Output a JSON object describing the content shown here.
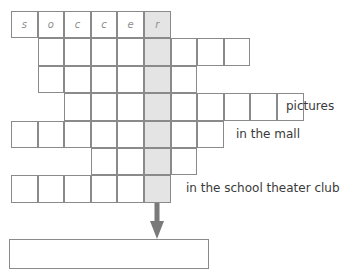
{
  "puzzle": {
    "grid_origin": {
      "x": 11,
      "y": 11
    },
    "cell_size": {
      "w": 26.6,
      "h": 27.4
    },
    "shaded_column": 5,
    "shade_color": "#e4e4e4",
    "border_color": "#8a8a8a",
    "rows": [
      {
        "start_col": 0,
        "length": 6,
        "letters": [
          "s",
          "o",
          "c",
          "c",
          "e",
          "r"
        ],
        "clue": ""
      },
      {
        "start_col": 1,
        "length": 8,
        "letters": [
          "",
          "",
          "",
          "",
          "",
          "",
          "",
          ""
        ],
        "clue": ""
      },
      {
        "start_col": 1,
        "length": 6,
        "letters": [
          "",
          "",
          "",
          "",
          "",
          ""
        ],
        "clue": ""
      },
      {
        "start_col": 2,
        "length": 9,
        "letters": [
          "",
          "",
          "",
          "",
          "",
          "",
          "",
          "",
          ""
        ],
        "clue": "pictures"
      },
      {
        "start_col": 0,
        "length": 8,
        "letters": [
          "",
          "",
          "",
          "",
          "",
          "",
          "",
          ""
        ],
        "clue": "in the mall"
      },
      {
        "start_col": 3,
        "length": 4,
        "letters": [
          "",
          "",
          "",
          ""
        ],
        "clue": ""
      },
      {
        "start_col": 0,
        "length": 6,
        "letters": [
          "",
          "",
          "",
          "",
          "",
          ""
        ],
        "clue": "in the school theater club"
      }
    ],
    "clues": {
      "row4": "pictures",
      "row5": "in the mall",
      "row7": "in the school theater club"
    },
    "arrow_icon": "down-arrow-icon",
    "arrow_color": "#7a7a7a",
    "answer_value": ""
  }
}
